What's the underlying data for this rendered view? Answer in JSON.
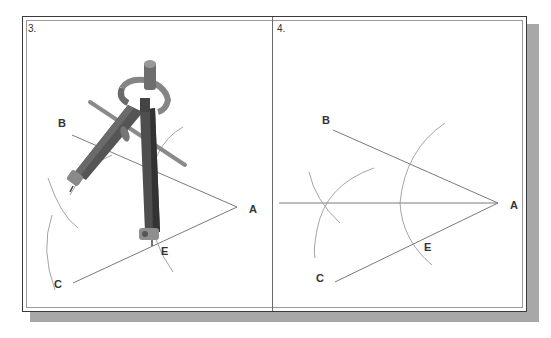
{
  "figure": {
    "panels": [
      {
        "number": "3.",
        "labels": {
          "A": "A",
          "B": "B",
          "C": "C",
          "E": "E"
        },
        "illustration": "compass-drawing-arcs"
      },
      {
        "number": "4.",
        "labels": {
          "A": "A",
          "B": "B",
          "C": "C",
          "E": "E"
        },
        "illustration": "angle-bisector-construction"
      }
    ]
  },
  "colors": {
    "frame_border": "#3a3a3a",
    "line": "#777777",
    "arc": "#9a9a9a",
    "compass_body": "#5e5e5e",
    "shadow": "#a8a8a8"
  }
}
